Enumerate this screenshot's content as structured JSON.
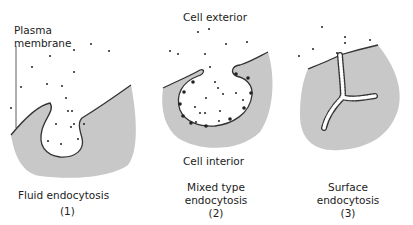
{
  "panels": [
    {
      "caption": "Fluid endocytosis",
      "number": "(1)",
      "label_top": "Plasma",
      "label_bottom": "membrane"
    },
    {
      "caption_line1": "Mixed type",
      "caption_line2": "endocytosis",
      "number": "(2)",
      "label_exterior": "Cell exterior",
      "label_interior": "Cell interior"
    },
    {
      "caption_line1": "Surface",
      "caption_line2": "endocytosis",
      "number": "(3)"
    }
  ],
  "colors": {
    "cell_fill": "#c8c8c8",
    "membrane": "#333333",
    "particle": "#222222"
  }
}
